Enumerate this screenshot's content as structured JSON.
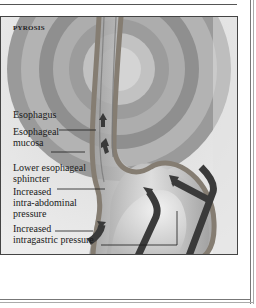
{
  "figure": {
    "title": "PYROSIS",
    "labels": {
      "esophagus": "Esophagus",
      "esophageal_mucosa": [
        "Esophageal",
        "mucosa"
      ],
      "lower_esophageal_sphincter": [
        "Lower esophageal",
        "sphincter"
      ],
      "intra_abdominal_pressure": [
        "Increased",
        "intra-abdominal",
        "pressure"
      ],
      "intragastric_pressure": [
        "Increased",
        "intragastric pressure"
      ]
    }
  },
  "colors": {
    "background": "#e6e6e6",
    "ring_dark": "#8a8a8a",
    "ring_light": "#b5b5b5",
    "tube_wall": "#8c8478",
    "arrow": "#3a3a3a",
    "frame_border": "#444444"
  }
}
